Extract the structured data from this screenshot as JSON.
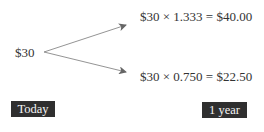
{
  "diagram": {
    "start_value": "$30",
    "outcomes": [
      {
        "expression": "$30 × 1.333 = $40.00",
        "direction": "up"
      },
      {
        "expression": "$30 × 0.750 = $22.50",
        "direction": "down"
      }
    ],
    "timeline": {
      "start_label": "Today",
      "end_label": "1 year"
    },
    "colors": {
      "arrow": "#777777",
      "label_bg": "#2f2f2f",
      "label_text": "#f4f4f4",
      "text": "#333333"
    }
  }
}
